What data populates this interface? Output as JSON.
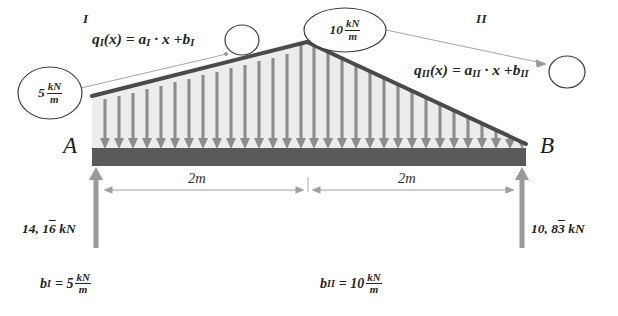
{
  "figure": {
    "regions": [
      {
        "name": "region-one-label",
        "text": "I"
      },
      {
        "name": "region-two-label",
        "text": "II"
      }
    ],
    "nodes": {
      "left": "A",
      "right": "B"
    },
    "equations": {
      "region_one": {
        "lhs": "q",
        "lhs_sub": "I",
        "body": "(x) = a",
        "body_sub": "I",
        "tail": " · x +",
        "circled": "b",
        "circled_sub": "I"
      },
      "region_two": {
        "lhs": "q",
        "lhs_sub": "II",
        "body": "(x) = a",
        "body_sub": "II",
        "tail": " · x +",
        "circled": "b",
        "circled_sub": "II"
      }
    },
    "load_values": {
      "left_end": {
        "value": "5",
        "unit_num": "kN",
        "unit_den": "m"
      },
      "peak": {
        "value": "10",
        "unit_num": "kN",
        "unit_den": "m"
      }
    },
    "dimensions": [
      {
        "label": "2m"
      },
      {
        "label": "2m"
      }
    ],
    "reactions": {
      "left": {
        "whole": "14, 1",
        "repeating": "6",
        "unit": " kN"
      },
      "right": {
        "whole": "10, 8",
        "repeating": "3",
        "unit": " kN"
      }
    },
    "coefficients": [
      {
        "symbol": "b",
        "sub": "I",
        "eq": "= 5",
        "unit_num": "kN",
        "unit_den": "m"
      },
      {
        "symbol": "b",
        "sub": "II",
        "eq": "= 10",
        "unit_num": "kN",
        "unit_den": "m"
      }
    ],
    "colors": {
      "beam": "#5a5a5a",
      "load_fill": "#ececec",
      "load_outline": "#4a4a4a",
      "arrow": "#8d8d8d",
      "support_arrow": "#9a9a9a",
      "dimension_line": "#a0a0a0",
      "leader_line": "#8a8a8a",
      "text": "#262626"
    },
    "geometry": {
      "beam_left_x": 92,
      "beam_right_x": 526,
      "beam_top_y": 148,
      "beam_bottom_y": 166,
      "apex_x": 307,
      "apex_y": 42,
      "left_load_top_y": 96,
      "right_load_end_y": 144,
      "load_arrow_count_left": 16,
      "load_arrow_count_right": 16
    }
  }
}
